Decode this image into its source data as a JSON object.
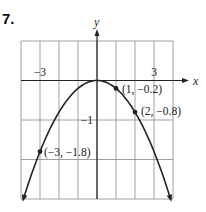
{
  "problem_number": "7.",
  "chart_data": {
    "type": "line",
    "title": "",
    "xlabel": "x",
    "ylabel": "y",
    "xlim": [
      -4,
      4
    ],
    "ylim": [
      -3,
      1
    ],
    "grid": true,
    "x_tick_labels": [
      {
        "value": -3,
        "label": "−3"
      },
      {
        "value": 3,
        "label": "3"
      }
    ],
    "y_tick_labels": [
      {
        "value": -1,
        "label": "−1"
      }
    ],
    "series": [
      {
        "name": "y = -0.2x^2",
        "function": "-0.2*x^2",
        "x_range": [
          -3.87,
          3.87
        ]
      }
    ],
    "points": [
      {
        "x": 1,
        "y": -0.2,
        "label": "(1, −0.2)"
      },
      {
        "x": 2,
        "y": -0.8,
        "label": "(2, −0.8)"
      },
      {
        "x": -3,
        "y": -1.8,
        "label": "(−3, −1.8)"
      }
    ]
  }
}
